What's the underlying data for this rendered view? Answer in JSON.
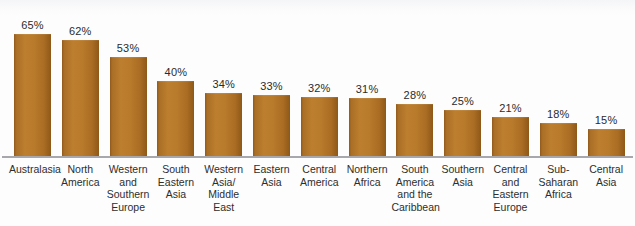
{
  "chart_data": {
    "type": "bar",
    "title": "",
    "subtitle": "",
    "xlabel": "",
    "ylabel": "",
    "ylim": [
      0,
      70
    ],
    "grid": false,
    "legend": "none",
    "orientation": "vertical",
    "value_suffix": "%",
    "bar_color": "#b8782c",
    "bar_color_dark": "#8d5817",
    "baseline_color": "#a8a8ac",
    "background_color": "#fdfdfd",
    "categories": [
      "Australasia",
      "North America",
      "Western and Southern Europe",
      "South Eastern Asia",
      "Western Asia/ Middle East",
      "Eastern Asia",
      "Central America",
      "Northern Africa",
      "South America and the Caribbean",
      "Southern Asia",
      "Central and Eastern Europe",
      "Sub-Saharan Africa",
      "Central Asia"
    ],
    "category_lines": [
      [
        "Australasia"
      ],
      [
        "North",
        "America"
      ],
      [
        "Western",
        "and",
        "Southern",
        "Europe"
      ],
      [
        "South",
        "Eastern",
        "Asia"
      ],
      [
        "Western",
        "Asia/",
        "Middle",
        "East"
      ],
      [
        "Eastern",
        "Asia"
      ],
      [
        "Central",
        "America"
      ],
      [
        "Northern",
        "Africa"
      ],
      [
        "South",
        "America",
        "and the",
        "Caribbean"
      ],
      [
        "Southern",
        "Asia"
      ],
      [
        "Central",
        "and",
        "Eastern",
        "Europe"
      ],
      [
        "Sub-",
        "Saharan",
        "Africa"
      ],
      [
        "Central",
        "Asia"
      ]
    ],
    "values": [
      65,
      62,
      53,
      40,
      34,
      33,
      32,
      31,
      28,
      25,
      21,
      18,
      15
    ],
    "value_labels": [
      "65%",
      "62%",
      "53%",
      "40%",
      "34%",
      "33%",
      "32%",
      "31%",
      "28%",
      "25%",
      "21%",
      "18%",
      "15%"
    ]
  }
}
